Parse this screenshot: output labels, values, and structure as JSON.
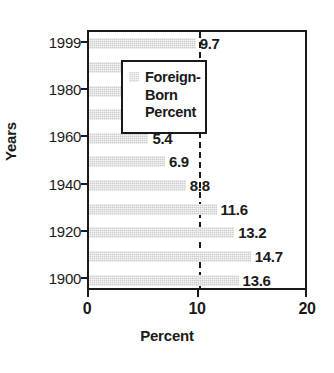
{
  "chart_data": {
    "type": "bar",
    "orientation": "horizontal",
    "title": "",
    "xlabel": "Percent",
    "ylabel": "Years",
    "xlim": [
      0,
      20
    ],
    "xticks": [
      "0",
      "10",
      "20"
    ],
    "xtick_values": [
      0,
      10,
      20
    ],
    "grid": "dashed vertical gridline at x=10",
    "legend_position": "upper-right inside plot",
    "categories": [
      "1999",
      "1990",
      "1980",
      "1970",
      "1960",
      "1950",
      "1940",
      "1930",
      "1920",
      "1910",
      "1900"
    ],
    "values": [
      9.7,
      8,
      6.2,
      4.8,
      5.4,
      6.9,
      8.8,
      11.6,
      13.2,
      14.7,
      13.6
    ],
    "value_labels": [
      "9.7",
      "8",
      "6.2",
      "4.8",
      "5.4",
      "6.9",
      "8.8",
      "11.6",
      "13.2",
      "14.7",
      "13.6"
    ],
    "visible_ytick_labels": [
      "1999",
      "1980",
      "1960",
      "1940",
      "1920",
      "1900"
    ],
    "visible_ytick_indices": [
      0,
      2,
      4,
      6,
      8,
      10
    ],
    "series": [
      {
        "name": "Foreign-Born Percent",
        "values": [
          9.7,
          8,
          6.2,
          4.8,
          5.4,
          6.9,
          8.8,
          11.6,
          13.2,
          14.7,
          13.6
        ]
      }
    ],
    "colors": {
      "bar": "#cdcdcd",
      "axis": "#1a1a1a",
      "text": "#1a1a1a",
      "background": "#ffffff"
    }
  },
  "legend": {
    "swatch_name": "foreign-born-percent-swatch",
    "lines": [
      "Foreign-",
      "Born",
      "Percent"
    ]
  },
  "axes": {
    "y_title": "Years",
    "x_title": "Percent"
  }
}
